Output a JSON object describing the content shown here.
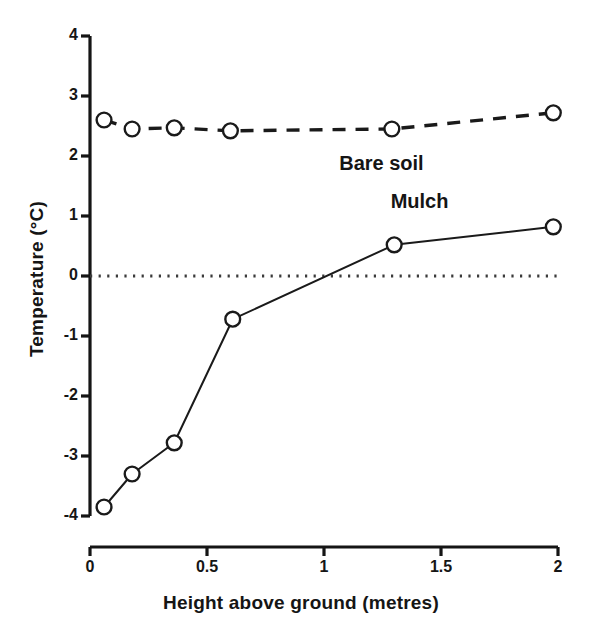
{
  "chart_data": {
    "type": "line",
    "title": "",
    "xlabel": "Height above ground (metres)",
    "ylabel": "Temperature (°C)",
    "xlim": [
      0,
      2
    ],
    "ylim": [
      -4,
      4
    ],
    "xticks": [
      0,
      0.5,
      1,
      1.5,
      2
    ],
    "xtick_labels": [
      "0",
      "0.5",
      "1",
      "1.5",
      "2"
    ],
    "yticks": [
      4,
      3,
      2,
      1,
      0,
      -1,
      -2,
      -3,
      -4
    ],
    "ytick_labels": [
      "4",
      "3",
      "2",
      "1",
      "0",
      "-1",
      "-2",
      "-3",
      "-4"
    ],
    "grid": false,
    "legend_position": "inline-annotations",
    "reference_lines": [
      {
        "name": "zero-line",
        "axis": "y",
        "value": 0,
        "style": "dotted"
      }
    ],
    "series": [
      {
        "name": "Bare soil",
        "label": "Bare soil",
        "linestyle": "dashed",
        "marker": "open-circle",
        "color": "#1a1a1a",
        "x": [
          0.06,
          0.18,
          0.36,
          0.6,
          1.29,
          1.98
        ],
        "y": [
          2.6,
          2.45,
          2.47,
          2.42,
          2.45,
          2.72
        ]
      },
      {
        "name": "Mulch",
        "label": "Mulch",
        "linestyle": "solid",
        "marker": "open-circle",
        "color": "#1a1a1a",
        "x": [
          0.06,
          0.18,
          0.36,
          0.61,
          1.3,
          1.98
        ],
        "y": [
          -3.85,
          -3.3,
          -2.78,
          -0.72,
          0.52,
          0.82
        ]
      }
    ],
    "annotations": [
      {
        "name": "bare-soil-label",
        "text": "Bare soil",
        "x": 1.3,
        "y": 1.85
      },
      {
        "name": "mulch-label",
        "text": "Mulch",
        "x": 1.52,
        "y": 1.22
      }
    ]
  }
}
